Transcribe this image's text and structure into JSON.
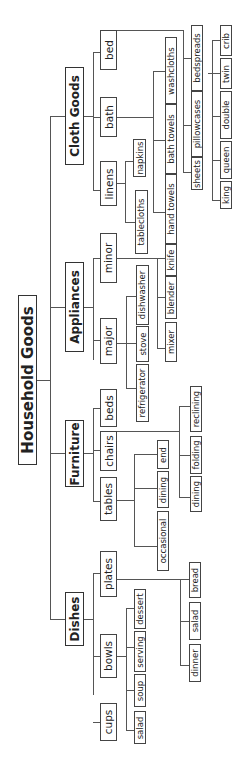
{
  "diagram": {
    "type": "tree",
    "orientation": "rotated-90-ccw",
    "root": {
      "label": "Household Goods",
      "children": [
        {
          "label": "Dishes",
          "children": [
            {
              "label": "cups",
              "children": []
            },
            {
              "label": "bowls",
              "children": [
                {
                  "label": "salad"
                },
                {
                  "label": "soup"
                },
                {
                  "label": "serving"
                },
                {
                  "label": "dessert"
                }
              ]
            },
            {
              "label": "plates",
              "children": [
                {
                  "label": "dinner"
                },
                {
                  "label": "salad"
                },
                {
                  "label": "bread"
                }
              ]
            }
          ]
        },
        {
          "label": "Furniture",
          "children": [
            {
              "label": "tables",
              "children": [
                {
                  "label": "occasional"
                },
                {
                  "label": "dining"
                },
                {
                  "label": "end"
                }
              ]
            },
            {
              "label": "chairs",
              "children": [
                {
                  "label": "dining"
                },
                {
                  "label": "folding"
                },
                {
                  "label": "reclining"
                }
              ]
            },
            {
              "label": "beds",
              "children": []
            }
          ]
        },
        {
          "label": "Appliances",
          "children": [
            {
              "label": "major",
              "children": [
                {
                  "label": "refrigerator"
                },
                {
                  "label": "stove"
                },
                {
                  "label": "dishwasher"
                }
              ]
            },
            {
              "label": "minor",
              "children": [
                {
                  "label": "mixer"
                },
                {
                  "label": "blender"
                },
                {
                  "label": "knife"
                }
              ]
            }
          ]
        },
        {
          "label": "Cloth Goods",
          "children": [
            {
              "label": "linens",
              "children": [
                {
                  "label": "tablecloths"
                },
                {
                  "label": "napkins"
                }
              ]
            },
            {
              "label": "bath",
              "children": [
                {
                  "label": "hand towels"
                },
                {
                  "label": "bath towels"
                },
                {
                  "label": "washcloths"
                }
              ]
            },
            {
              "label": "bed",
              "children": [
                {
                  "label": "sheets"
                },
                {
                  "label": "pillowcases"
                },
                {
                  "label": "bedspreads",
                  "children": [
                    {
                      "label": "king"
                    },
                    {
                      "label": "queen"
                    },
                    {
                      "label": "double"
                    },
                    {
                      "label": "twin"
                    },
                    {
                      "label": "crib"
                    }
                  ]
                }
              ]
            }
          ]
        }
      ]
    }
  },
  "nodes": {
    "root": "Household Goods",
    "dishes": "Dishes",
    "furniture": "Furniture",
    "appliances": "Appliances",
    "cloth": "Cloth Goods",
    "cups": "cups",
    "bowls": "bowls",
    "plates": "plates",
    "bowls_salad": "salad",
    "soup": "soup",
    "serving": "serving",
    "dessert": "dessert",
    "dinner": "dinner",
    "plates_salad": "salad",
    "bread": "bread",
    "tables": "tables",
    "chairs": "chairs",
    "beds": "beds",
    "occasional": "occasional",
    "tables_dining": "dining",
    "end": "end",
    "chairs_dining": "dining",
    "folding": "folding",
    "reclining": "reclining",
    "major": "major",
    "minor": "minor",
    "refrigerator": "refrigerator",
    "stove": "stove",
    "dishwasher": "dishwasher",
    "mixer": "mixer",
    "blender": "blender",
    "knife": "knife",
    "linens": "linens",
    "bath": "bath",
    "bed": "bed",
    "tablecloths": "tablecloths",
    "napkins": "napkins",
    "hand_towels": "hand towels",
    "bath_towels": "bath towels",
    "washcloths": "washcloths",
    "sheets": "sheets",
    "pillowcases": "pillowcases",
    "bedspreads": "bedspreads",
    "king": "king",
    "queen": "queen",
    "double": "double",
    "twin": "twin",
    "crib": "crib"
  }
}
